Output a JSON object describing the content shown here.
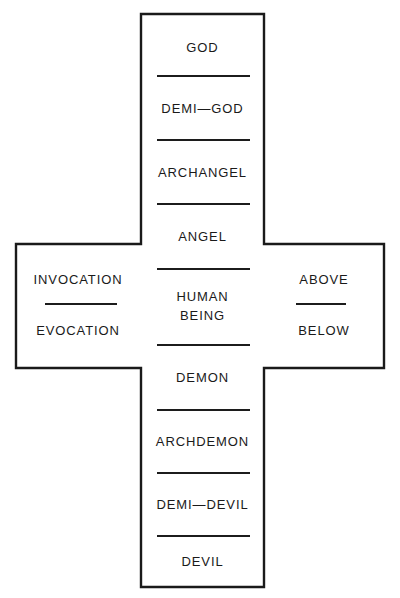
{
  "diagram": {
    "shape": "cross",
    "stroke_color": "#1a1a1a",
    "background_color": "#ffffff",
    "vertical_axis": {
      "label": "spiritual hierarchy",
      "cells": [
        {
          "label": "GOD"
        },
        {
          "label": "DEMI—GOD"
        },
        {
          "label": "ARCHANGEL"
        },
        {
          "label": "ANGEL"
        },
        {
          "label": "HUMAN\nBEING",
          "line1": "HUMAN",
          "line2": "BEING"
        },
        {
          "label": "DEMON"
        },
        {
          "label": "ARCHDEMON"
        },
        {
          "label": "DEMI—DEVIL"
        },
        {
          "label": "DEVIL"
        }
      ]
    },
    "left_arm": {
      "cells": [
        {
          "label": "INVOCATION"
        },
        {
          "label": "EVOCATION"
        }
      ]
    },
    "right_arm": {
      "cells": [
        {
          "label": "ABOVE"
        },
        {
          "label": "BELOW"
        }
      ]
    }
  }
}
